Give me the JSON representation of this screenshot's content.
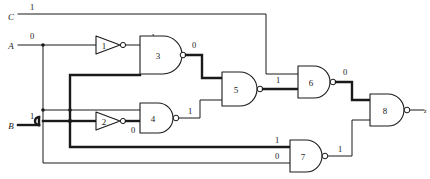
{
  "diagram": {
    "type": "logic-circuit-schematic",
    "colors": {
      "wire": "#1a1a1a",
      "background": "#ffffff",
      "highlight_path": "#1a1a1a"
    }
  },
  "inputs": [
    {
      "id": "C",
      "label": "C",
      "value": "1"
    },
    {
      "id": "A",
      "label": "A",
      "value": "0"
    },
    {
      "id": "B",
      "label": "B",
      "value": "1"
    }
  ],
  "outputs": [
    {
      "id": "z",
      "label": "z"
    }
  ],
  "gates": [
    {
      "id": "g1",
      "number": "1",
      "type": "inverter",
      "output_value": "1"
    },
    {
      "id": "g2",
      "number": "2",
      "type": "inverter",
      "output_value": "0"
    },
    {
      "id": "g3",
      "number": "3",
      "type": "nand",
      "output_value": "0"
    },
    {
      "id": "g4",
      "number": "4",
      "type": "nand",
      "output_value": "1"
    },
    {
      "id": "g5",
      "number": "5",
      "type": "nand",
      "output_value": "1"
    },
    {
      "id": "g6",
      "number": "6",
      "type": "nand",
      "output_value": "0"
    },
    {
      "id": "g7",
      "number": "7",
      "type": "nand",
      "output_value": "1"
    },
    {
      "id": "g8",
      "number": "8",
      "type": "nand",
      "output_value": ""
    }
  ],
  "signal_values": {
    "c_input": "1",
    "a_input": "0",
    "b_input": "1",
    "inv1_out": "1",
    "inv2_out": "0",
    "nand3_out": "0",
    "nand4_out": "1",
    "nand5_out": "1",
    "nand6_out": "0",
    "nand7_in_top": "1",
    "nand7_in_bottom": "0",
    "nand7_out": "1"
  }
}
